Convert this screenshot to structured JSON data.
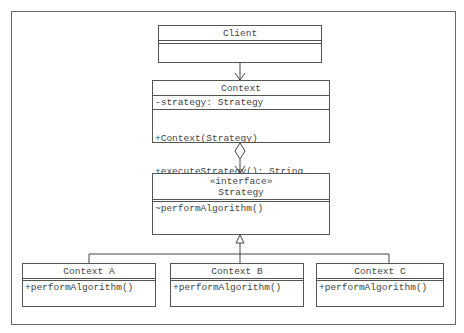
{
  "diagram": {
    "type": "UML class diagram",
    "pattern": "Strategy",
    "classes": {
      "client": {
        "name": "Client",
        "attributes": [],
        "methods": []
      },
      "context": {
        "name": "Context",
        "attributes": [
          "-strategy: Strategy"
        ],
        "methods": [
          "+Context(Strategy)",
          "+executeStrategy(): String"
        ]
      },
      "strategy": {
        "stereotype": "«interface»",
        "name": "Strategy",
        "methods": [
          "~performAlgorithm()"
        ]
      },
      "context_a": {
        "name": "Context A",
        "methods": [
          "+performAlgorithm()"
        ]
      },
      "context_b": {
        "name": "Context B",
        "methods": [
          "+performAlgorithm()"
        ]
      },
      "context_c": {
        "name": "Context C",
        "methods": [
          "+performAlgorithm()"
        ]
      }
    },
    "relationships": [
      {
        "from": "Client",
        "to": "Context",
        "kind": "association-arrow"
      },
      {
        "from": "Context",
        "to": "Strategy",
        "kind": "aggregation"
      },
      {
        "from": "Context A",
        "to": "Strategy",
        "kind": "realization"
      },
      {
        "from": "Context B",
        "to": "Strategy",
        "kind": "realization"
      },
      {
        "from": "Context C",
        "to": "Strategy",
        "kind": "realization"
      }
    ]
  }
}
